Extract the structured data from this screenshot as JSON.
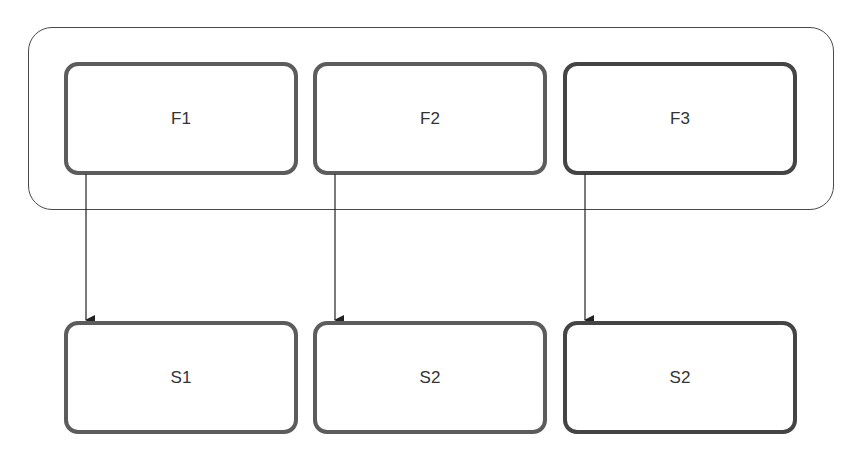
{
  "diagram": {
    "group": {
      "label": ""
    },
    "top_nodes": [
      {
        "id": "F1",
        "label": "F1"
      },
      {
        "id": "F2",
        "label": "F2"
      },
      {
        "id": "F3",
        "label": "F3"
      }
    ],
    "bottom_nodes": [
      {
        "id": "S1",
        "label": "S1"
      },
      {
        "id": "S2a",
        "label": "S2"
      },
      {
        "id": "S2b",
        "label": "S2"
      }
    ],
    "edges": [
      {
        "from": "F1",
        "to": "S1"
      },
      {
        "from": "F2",
        "to": "S2a"
      },
      {
        "from": "F3",
        "to": "S2b"
      }
    ],
    "colors": {
      "border": "#5c5c5c",
      "line": "#222222",
      "text": "#333333"
    }
  }
}
